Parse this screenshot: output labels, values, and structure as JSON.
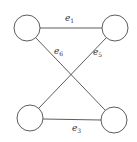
{
  "diagram": {
    "type": "graph",
    "nodes": [
      {
        "id": "top-left",
        "cx": 27,
        "cy": 28,
        "r": 13
      },
      {
        "id": "top-right",
        "cx": 115,
        "cy": 28,
        "r": 13
      },
      {
        "id": "bottom-left",
        "cx": 30,
        "cy": 118,
        "r": 13
      },
      {
        "id": "bottom-right",
        "cx": 114,
        "cy": 120,
        "r": 13
      }
    ],
    "edges": [
      {
        "id": "e1",
        "label_base": "e",
        "label_sub": "1",
        "from": "top-left",
        "to": "top-right",
        "lx": 65,
        "ly": 21
      },
      {
        "id": "e6",
        "label_base": "e",
        "label_sub": "6",
        "from": "top-left",
        "to": "bottom-right",
        "lx": 54,
        "ly": 54
      },
      {
        "id": "e5",
        "label_base": "e",
        "label_sub": "5",
        "from": "top-right",
        "to": "bottom-left",
        "lx": 93,
        "ly": 55
      },
      {
        "id": "e3",
        "label_base": "e",
        "label_sub": "3",
        "from": "bottom-left",
        "to": "bottom-right",
        "lx": 72,
        "ly": 131
      }
    ],
    "colors": {
      "stroke": "#333333",
      "background": "#ffffff"
    }
  }
}
